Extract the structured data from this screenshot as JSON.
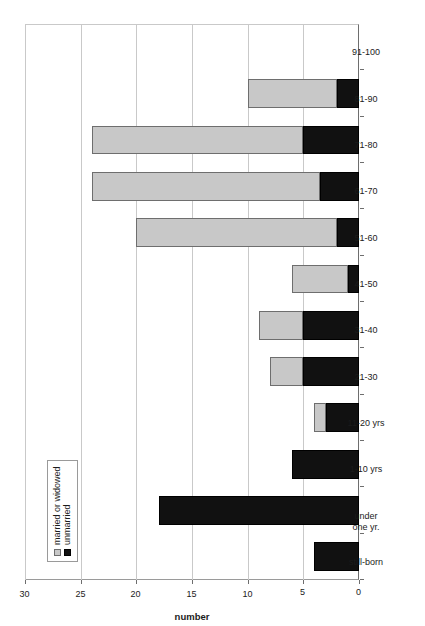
{
  "chart_data": {
    "type": "bar",
    "orientation": "vertical-rendered-rotated",
    "title": "",
    "xlabel": "",
    "ylabel": "number",
    "ylim": [
      0,
      30
    ],
    "yticks": [
      "0",
      "5",
      "10",
      "15",
      "20",
      "25",
      "30"
    ],
    "grid": true,
    "stacked": true,
    "legend_position": "inside-upper-left",
    "categories": [
      "still-born",
      "under one yr.",
      "1-10 yrs",
      "11-20 yrs",
      "21-30",
      "31-40",
      "41-50",
      "51-60",
      "61-70",
      "71-80",
      "81-90",
      "91-100"
    ],
    "category_labels": [
      {
        "line1": "still-born",
        "line2": ""
      },
      {
        "line1": "under",
        "line2": "one yr."
      },
      {
        "line1": "1-10 yrs",
        "line2": ""
      },
      {
        "line1": "11-20 yrs",
        "line2": ""
      },
      {
        "line1": "21-30",
        "line2": ""
      },
      {
        "line1": "31-40",
        "line2": ""
      },
      {
        "line1": "41-50",
        "line2": ""
      },
      {
        "line1": "51-60",
        "line2": ""
      },
      {
        "line1": "61-70",
        "line2": ""
      },
      {
        "line1": "71-80",
        "line2": ""
      },
      {
        "line1": "81-90",
        "line2": ""
      },
      {
        "line1": "91-100",
        "line2": ""
      }
    ],
    "series": [
      {
        "name": "unmarried",
        "color": "#111111",
        "values": [
          4,
          18,
          6,
          3,
          5,
          5,
          1,
          2,
          3.5,
          5,
          2,
          0
        ]
      },
      {
        "name": "married or widowed",
        "color": "#c8c8c8",
        "values": [
          0,
          0,
          0,
          1,
          3,
          4,
          5,
          18,
          20.5,
          19,
          8,
          0
        ]
      }
    ],
    "totals": [
      4,
      18,
      6,
      4,
      8,
      9,
      6,
      20,
      24,
      24,
      10,
      0
    ]
  },
  "legend": {
    "entries": [
      {
        "label": "married or widowed",
        "swatch": "married"
      },
      {
        "label": "unmarried",
        "swatch": "unmarried"
      }
    ]
  }
}
